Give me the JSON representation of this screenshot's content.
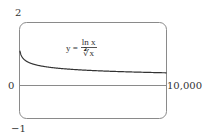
{
  "chart_data": {
    "type": "line",
    "title": "",
    "annotation": {
      "lhs": "y =",
      "numerator": "ln x",
      "denominator": "∛x"
    },
    "function": "y = ln(x) / x^(1/3)",
    "xlim": [
      0,
      10000
    ],
    "ylim": [
      -1,
      2
    ],
    "x_tick_labels": [
      "0",
      "10,000"
    ],
    "y_tick_labels": [
      "2",
      "-1"
    ],
    "xlabel": "",
    "ylabel": "",
    "grid": false,
    "series": [
      {
        "name": "y = ln x / ∛x",
        "x": [
          1,
          20,
          100,
          500,
          1000,
          2000,
          4000,
          6000,
          8000,
          10000
        ],
        "values": [
          0,
          1.104,
          0.992,
          0.787,
          0.691,
          0.603,
          0.521,
          0.477,
          0.449,
          0.428
        ]
      }
    ]
  },
  "labels": {
    "y_top": "2",
    "y_bottom": "−1",
    "x_left": "0",
    "x_right": "10,000",
    "eq_lhs": "y =",
    "eq_num": "ln x",
    "eq_den": "∛x"
  },
  "colors": {
    "frame": "#8a8a8a",
    "curve": "#333333",
    "axis": "#8a8a8a"
  }
}
